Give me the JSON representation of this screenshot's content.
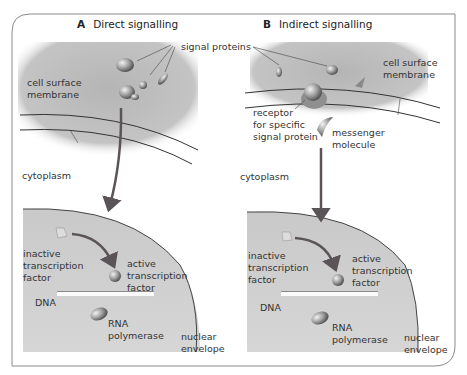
{
  "panels": [
    {
      "letter": "A",
      "title": "Direct signalling",
      "labels": {
        "signal_proteins": "signal proteins",
        "cell_surface_membrane": "cell surface\nmembrane",
        "cytoplasm": "cytoplasm",
        "inactive_tf": "inactive\ntranscription\nfactor",
        "active_tf": "active\ntranscription\nfactor",
        "dna": "DNA",
        "rna_polymerase": "RNA\npolymerase",
        "nuclear_envelope": "nuclear\nenvelope"
      }
    },
    {
      "letter": "B",
      "title": "Indirect signalling",
      "labels": {
        "cell_surface_membrane": "cell surface\nmembrane",
        "receptor": "receptor\nfor specific\nsignal protein",
        "messenger": "messenger\nmolecule",
        "cytoplasm": "cytoplasm",
        "inactive_tf": "inactive\ntranscription\nfactor",
        "active_tf": "active\ntranscription\nfactor",
        "dna": "DNA",
        "rna_polymerase": "RNA\npolymerase",
        "nuclear_envelope": "nuclear\nenvelope"
      }
    }
  ],
  "colors": {
    "extracellular": "#bdbdbd",
    "nucleus": "#c8c8c8",
    "arrow": "#5a5358",
    "frame": "#8a8a8a"
  }
}
